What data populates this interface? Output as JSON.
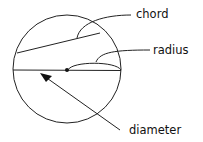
{
  "diagram": {
    "labels": {
      "chord": "chord",
      "radius": "radius",
      "diameter": "diameter"
    },
    "colors": {
      "stroke": "#222222",
      "text": "#111111",
      "background": "#ffffff"
    }
  }
}
